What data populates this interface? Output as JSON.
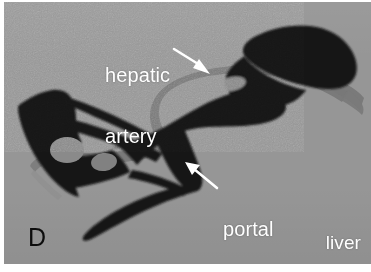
{
  "figure": {
    "panel_letter": "D",
    "specimen_label": "liver",
    "width_px": 371,
    "height_px": 272,
    "background_color": "#969696",
    "plate_border_color": "#ffffff"
  },
  "annotations": [
    {
      "id": "hepatic-artery",
      "text": "hepatic\nartery",
      "line1": "hepatic",
      "line2": "artery",
      "color": "#ffffff",
      "arrow_direction": "down-right",
      "arrow_from": [
        174,
        54
      ],
      "arrow_to": [
        207,
        74
      ],
      "points_at": "hepatic-artery-vessel"
    },
    {
      "id": "portal-vein",
      "text": "portal\nvein",
      "line1": "portal",
      "line2": "vein",
      "color": "#ffffff",
      "arrow_direction": "up-left",
      "arrow_from": [
        216,
        188
      ],
      "arrow_to": [
        185,
        163
      ],
      "points_at": "portal-vein-vessel"
    }
  ],
  "structures": [
    {
      "id": "portal-vein-vessel",
      "name": "portal vein",
      "color": "#141414",
      "description": "large black branching venous cast spanning the field diagonally from lower-left lobe to upper-right lobe"
    },
    {
      "id": "hepatic-artery-vessel",
      "name": "hepatic artery",
      "color": "#787878",
      "description": "mid-gray ribbon arcing over the portal vein from left hilum toward the upper-right lobe"
    },
    {
      "id": "artery-cross-section",
      "name": "hepatic artery cross-section",
      "color": "#8a8a8a",
      "description": "gray elliptical blob embedded within the left portal venous mass"
    }
  ],
  "colors": {
    "background": "#969696",
    "vein_black": "#141414",
    "artery_gray": "#787878",
    "artery_blob_gray": "#8a8a8a",
    "label_white": "#ffffff",
    "label_black": "#0d0d0d"
  }
}
